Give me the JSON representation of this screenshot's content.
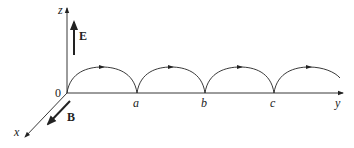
{
  "figure": {
    "type": "cycloid-trajectory-diagram",
    "axes": {
      "x": {
        "label": "x"
      },
      "y": {
        "label": "y"
      },
      "z": {
        "label": "z"
      },
      "origin": {
        "label": "0"
      }
    },
    "vectors": {
      "E": {
        "label": "E",
        "direction": "+z"
      },
      "B": {
        "label": "B",
        "direction": "+x"
      }
    },
    "points_on_y": [
      {
        "label": "a"
      },
      {
        "label": "b"
      },
      {
        "label": "c"
      }
    ],
    "trajectory": {
      "shape": "cycloid",
      "arcs": 4,
      "direction_marker": "arrow on each arc"
    },
    "colors": {
      "ink": "#222222",
      "background": "#ffffff"
    }
  }
}
